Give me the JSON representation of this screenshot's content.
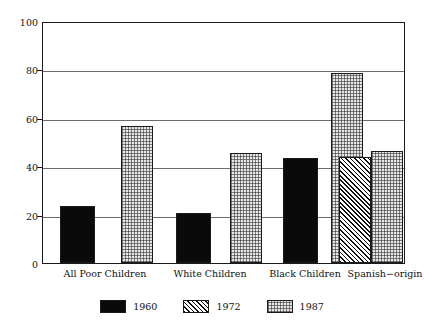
{
  "chart_data": {
    "type": "bar",
    "title": "",
    "subtitle": "",
    "xlabel": "",
    "ylabel": "",
    "ylim": [
      0,
      100
    ],
    "yticks": [
      0,
      20,
      40,
      60,
      80,
      100
    ],
    "ytick_labels": [
      "0",
      "20",
      "40",
      "60",
      "80",
      "100"
    ],
    "grid": true,
    "legend_position": "bottom",
    "categories": [
      "All Poor Children",
      "White Children",
      "Black Children",
      "Spanish-origin"
    ],
    "series": [
      {
        "name": "1960",
        "pattern": "solid-black",
        "color": "#0a0a0a",
        "values": [
          23.6,
          20.7,
          43.8,
          null
        ]
      },
      {
        "name": "1972",
        "pattern": "diagonal-hatch",
        "color": "#ffffff",
        "values": [
          null,
          null,
          null,
          44.0
        ]
      },
      {
        "name": "1987",
        "pattern": "light-dotted-grid",
        "color": "#e6e6e6",
        "values": [
          57.0,
          46.0,
          79.0,
          46.7
        ]
      }
    ]
  },
  "axes": {
    "y_ticks": [
      {
        "label": "100",
        "value": 100
      },
      {
        "label": "80",
        "value": 80
      },
      {
        "label": "60",
        "value": 60
      },
      {
        "label": "40",
        "value": 40
      },
      {
        "label": "20",
        "value": 20
      },
      {
        "label": "0",
        "value": 0
      }
    ],
    "x_categories": [
      {
        "label": "All Poor Children"
      },
      {
        "label": "White Children"
      },
      {
        "label": "Black Children"
      },
      {
        "label": "Spanish−origin"
      }
    ]
  },
  "legend": {
    "items": [
      {
        "label": "1960"
      },
      {
        "label": "1972"
      },
      {
        "label": "1987"
      }
    ]
  }
}
